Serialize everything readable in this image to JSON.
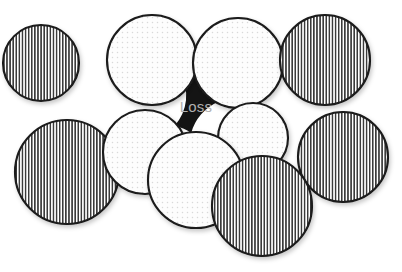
{
  "figure": {
    "name": "circle-packing-loss-diagram",
    "background_color": "#ffffff",
    "width": 402,
    "height": 272,
    "annotation": {
      "label": "Loss",
      "text_color": "#b0b0b0",
      "region_color": "#141414",
      "x": 196,
      "y": 108
    },
    "outline_color": "#1a1a1a",
    "fills": {
      "striped_base": "#ffffff",
      "striped_line": "#3a3a3a",
      "dotted_base": "#fdfdfd",
      "dotted_dot": "#d8d8d8",
      "gap": "#141414"
    },
    "circles": [
      {
        "id": "circle-striped-top-left",
        "fill": "striped",
        "cx": 41,
        "cy": 63,
        "r": 38
      },
      {
        "id": "circle-dotted-top-left",
        "fill": "dotted",
        "cx": 152,
        "cy": 60,
        "r": 45
      },
      {
        "id": "circle-dotted-top-right",
        "fill": "dotted",
        "cx": 238,
        "cy": 63,
        "r": 45
      },
      {
        "id": "circle-striped-top-right",
        "fill": "striped",
        "cx": 325,
        "cy": 60,
        "r": 45
      },
      {
        "id": "circle-striped-mid-left",
        "fill": "striped",
        "cx": 67,
        "cy": 172,
        "r": 52
      },
      {
        "id": "circle-dotted-mid-left",
        "fill": "dotted",
        "cx": 145,
        "cy": 152,
        "r": 42
      },
      {
        "id": "circle-dotted-mid-right",
        "fill": "dotted",
        "cx": 253,
        "cy": 138,
        "r": 35
      },
      {
        "id": "circle-striped-mid-right",
        "fill": "striped",
        "cx": 343,
        "cy": 157,
        "r": 45
      },
      {
        "id": "circle-dotted-bottom-center",
        "fill": "dotted",
        "cx": 196,
        "cy": 180,
        "r": 48
      },
      {
        "id": "circle-striped-bottom",
        "fill": "striped",
        "cx": 262,
        "cy": 206,
        "r": 50
      }
    ]
  }
}
